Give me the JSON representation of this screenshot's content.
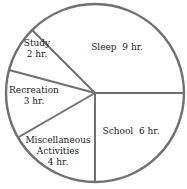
{
  "chart_data": {
    "type": "pie",
    "title": "",
    "unit": "hr.",
    "total": 24,
    "start_angle_deg": 0,
    "direction": "counterclockwise",
    "slices": [
      {
        "name": "Sleep",
        "value": 9,
        "label_lines": [
          "Sleep  9 hr."
        ],
        "label_pos": [
          117,
          50
        ]
      },
      {
        "name": "Study",
        "value": 2,
        "label_lines": [
          "Study",
          "2 hr."
        ],
        "label_pos": [
          37,
          46
        ]
      },
      {
        "name": "Recreation",
        "value": 3,
        "label_lines": [
          "Recreation",
          "3 hr."
        ],
        "label_pos": [
          34,
          93
        ]
      },
      {
        "name": "Miscellaneous Activities",
        "value": 4,
        "label_lines": [
          "Miscellaneous",
          "Activities",
          "4 hr."
        ],
        "label_pos": [
          58,
          143
        ]
      },
      {
        "name": "School",
        "value": 6,
        "label_lines": [
          "School  6 hr."
        ],
        "label_pos": [
          131,
          134
        ]
      }
    ],
    "categories": [
      "Sleep",
      "Study",
      "Recreation",
      "Miscellaneous Activities",
      "School"
    ],
    "values": [
      9,
      2,
      3,
      4,
      6
    ],
    "legend": "none (labels inside slices)"
  },
  "geometry": {
    "cx": 95,
    "cy": 93,
    "r": 89
  },
  "colors": {
    "stroke": "#707070",
    "fill": "#ffffff",
    "text": "#222222"
  }
}
